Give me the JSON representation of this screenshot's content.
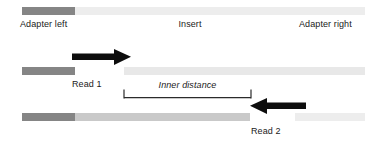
{
  "figure": {
    "type": "diagram",
    "background": "#ffffff"
  },
  "labels": {
    "adapter_left": "Adapter left",
    "insert": "Insert",
    "adapter_right": "Adapter right",
    "read1": "Read 1",
    "read2": "Read 2",
    "inner_distance": "Inner distance"
  },
  "colors": {
    "adapter_dark": "#858585",
    "insert_light": "#ededed",
    "insert_medium": "#c9c9c9",
    "read_track_light": "#e8e8e8",
    "arrow_black": "#0d0d0d",
    "bracket_line": "#2b2b2b",
    "text": "#1a1a1a"
  },
  "tracks": {
    "fragment": {
      "name": "fragment-track",
      "segments": [
        {
          "name": "adapter-left-segment",
          "x": 22,
          "width": 53,
          "color": "#858585"
        },
        {
          "name": "insert-segment",
          "x": 75,
          "width": 290,
          "color": "#ededed"
        }
      ]
    },
    "read1": {
      "name": "read1-track",
      "segments": [
        {
          "name": "read1-adapter-segment",
          "x": 22,
          "width": 53,
          "color": "#858585"
        },
        {
          "name": "read1-insert-segment",
          "x": 124,
          "width": 241,
          "color": "#e8e8e8"
        }
      ]
    },
    "read2": {
      "name": "read2-track",
      "segments": [
        {
          "name": "read2-adapter-segment",
          "x": 22,
          "width": 53,
          "color": "#858585"
        },
        {
          "name": "read2-insert-segment",
          "x": 75,
          "width": 175,
          "color": "#c9c9c9"
        },
        {
          "name": "read2-tail-segment",
          "x": 295,
          "width": 70,
          "color": "#ededed"
        }
      ]
    }
  },
  "arrows": {
    "read1_arrow": {
      "direction": "right",
      "x_start": 72,
      "x_end": 131,
      "y": 56
    },
    "read2_arrow": {
      "direction": "left",
      "x_start": 250,
      "x_end": 306,
      "y": 105
    }
  },
  "bracket": {
    "name": "inner-distance-bracket",
    "x_start": 124,
    "x_end": 251,
    "y": 94
  }
}
